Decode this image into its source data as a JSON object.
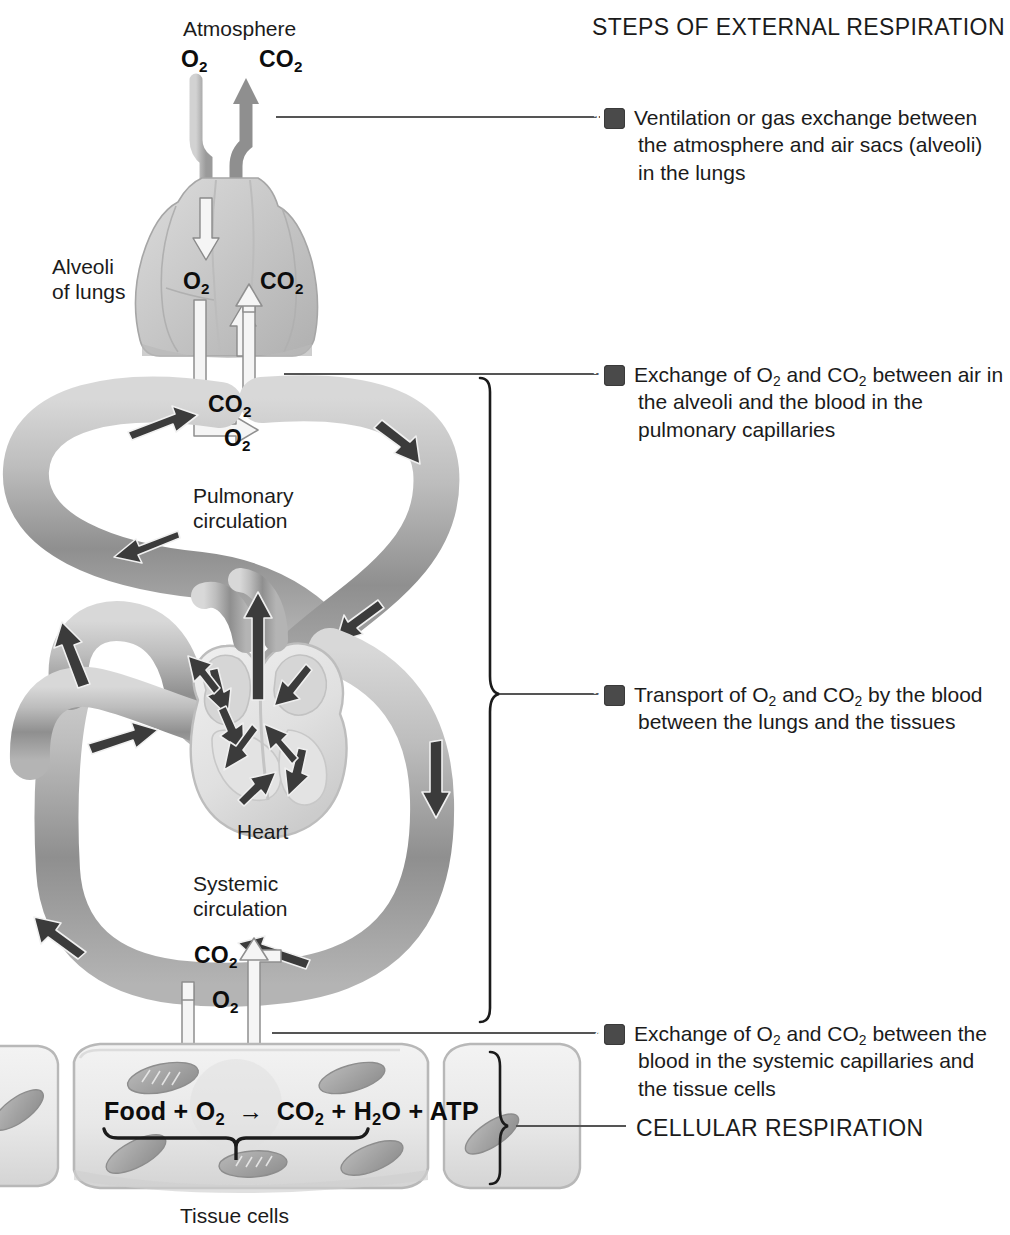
{
  "title": "STEPS OF EXTERNAL RESPIRATION",
  "steps": [
    {
      "number": "1",
      "text": "Ventilation or gas exchange between the atmosphere and air sacs (alveoli) in the lungs"
    },
    {
      "number": "2",
      "text_parts": [
        "Exchange of O",
        "2",
        " and CO",
        "2",
        " between air in the alveoli and the blood in the pulmonary capillaries"
      ]
    },
    {
      "number": "3",
      "text_parts": [
        "Transport of O",
        "2",
        " and CO",
        "2",
        " by the blood between the lungs and the tissues"
      ]
    },
    {
      "number": "4",
      "text_parts": [
        "Exchange of O",
        "2",
        " and CO",
        "2",
        " between the blood in the systemic capillaries and the tissue cells"
      ]
    }
  ],
  "cellular_respiration_label": "CELLULAR RESPIRATION",
  "diagram": {
    "atmosphere_label": "Atmosphere",
    "alveoli_label": "Alveoli\nof lungs",
    "alveoli_label_line1": "Alveoli",
    "alveoli_label_line2": "of lungs",
    "pulmonary_label_line1": "Pulmonary",
    "pulmonary_label_line2": "circulation",
    "systemic_label_line1": "Systemic",
    "systemic_label_line2": "circulation",
    "heart_label": "Heart",
    "tissue_cells_label": "Tissue cells",
    "gas_labels": {
      "o2": "O",
      "o2_sub": "2",
      "co2": "CO",
      "co2_sub": "2"
    },
    "equation": {
      "full": "Food + O2 → CO2 + H2O + ATP",
      "reactant_1": "Food",
      "plus": "+",
      "reactant_2": "O",
      "reactant_2_sub": "2",
      "arrow": "→",
      "product_1": "CO",
      "product_1_sub": "2",
      "product_2": "H",
      "product_2_sub": "2",
      "product_2_tail": "O",
      "product_3": "ATP"
    }
  },
  "colors": {
    "ink": "#1b1b1b",
    "badge": "#4a4a4a",
    "vessel_light": "#c9c9c9",
    "vessel_mid": "#9d9d9d",
    "vessel_dark": "#6e6e6e",
    "arrow_dark": "#3a3a3a",
    "arrow_white": "#f2f2f2",
    "lung": "#cfcfcf",
    "cell_fill": "#ededed",
    "leader": "#5a5a5a"
  }
}
